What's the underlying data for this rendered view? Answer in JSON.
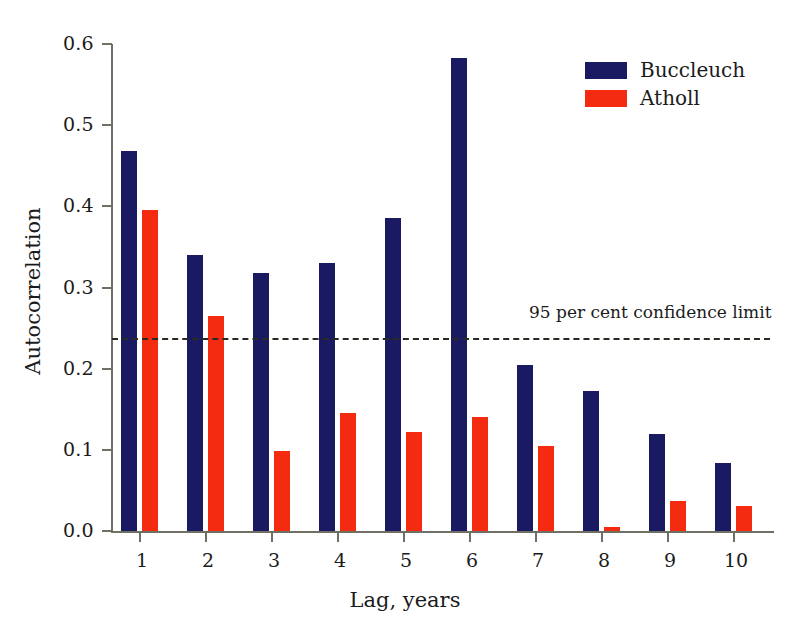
{
  "chart_data": {
    "type": "bar",
    "title": "",
    "xlabel": "Lag, years",
    "ylabel": "Autocorrelation",
    "categories": [
      "1",
      "2",
      "3",
      "4",
      "5",
      "6",
      "7",
      "8",
      "9",
      "10"
    ],
    "series": [
      {
        "name": "Buccleuch",
        "color": "#1a1a63",
        "values": [
          0.468,
          0.34,
          0.318,
          0.33,
          0.386,
          0.583,
          0.204,
          0.172,
          0.12,
          0.084
        ]
      },
      {
        "name": "Atholl",
        "color": "#f42b10",
        "values": [
          0.395,
          0.265,
          0.098,
          0.145,
          0.122,
          0.141,
          0.105,
          0.005,
          0.037,
          0.031
        ]
      }
    ],
    "ylim": [
      0.0,
      0.6
    ],
    "ytick_labels": [
      "0.0",
      "0.1",
      "0.2",
      "0.3",
      "0.4",
      "0.5",
      "0.6"
    ],
    "ytick_values": [
      0.0,
      0.1,
      0.2,
      0.3,
      0.4,
      0.5,
      0.6
    ],
    "grid": false,
    "legend_position": "top-right",
    "annotations": [
      {
        "name": "confidence-limit",
        "label": "95 per cent confidence limit",
        "value": 0.238,
        "style": "dashed",
        "color": "#2a2a22"
      }
    ]
  }
}
